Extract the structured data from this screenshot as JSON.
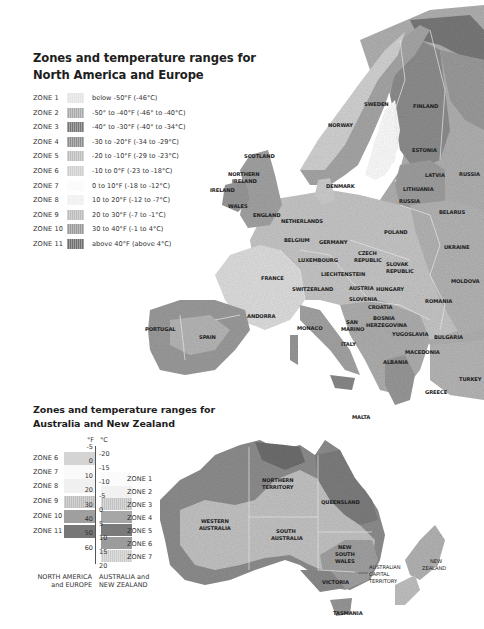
{
  "north_america_europe": {
    "title_line1": "Zones and temperature ranges for",
    "title_line2": "North America and Europe",
    "zones": [
      {
        "zone": "ZONE 1",
        "range": "below -50°F (-46°C)",
        "color": "#e4e4e4"
      },
      {
        "zone": "ZONE 2",
        "range": "-50° to -40°F (-46° to -40°C)",
        "color": "#a9a9a9"
      },
      {
        "zone": "ZONE 3",
        "range": "-40° to -30°F (-40° to -34°C)",
        "color": "#767676"
      },
      {
        "zone": "ZONE 4",
        "range": "-30 to -20°F (-34 to -29°C)",
        "color": "#8c8c8c"
      },
      {
        "zone": "ZONE 5",
        "range": "-20 to -10°F (-29 to -23°C)",
        "color": "#bdbdbd"
      },
      {
        "zone": "ZONE 6",
        "range": "-10 to 0°F (-23 to -18°C)",
        "color": "#cfcfcf"
      },
      {
        "zone": "ZONE 7",
        "range": "0 to 10°F (-18 to -12°C)",
        "color": "#fafafa"
      },
      {
        "zone": "ZONE 8",
        "range": "10 to 20°F (-12 to -7°C)",
        "color": "#efefef"
      },
      {
        "zone": "ZONE 9",
        "range": "20 to 30°F (-7 to -1°C)",
        "color": "#bbbbbb"
      },
      {
        "zone": "ZONE 10",
        "range": "30 to 40°F (-1 to 4°C)",
        "color": "#999999"
      },
      {
        "zone": "ZONE 11",
        "range": "above 40°F (above 4°C)",
        "color": "#6e6e6e"
      }
    ]
  },
  "australia_nz": {
    "title_line1": "Zones and temperature ranges for",
    "title_line2": "Australia and New Zealand",
    "unit_f": "°F",
    "unit_c": "°C",
    "f_ticks": [
      "-5",
      "0",
      "10",
      "20",
      "30",
      "40",
      "50",
      "60"
    ],
    "c_ticks": [
      "-20",
      "-15",
      "-10",
      "-5",
      "0",
      "5",
      "10",
      "15",
      "20"
    ],
    "na_zones": [
      "ZONE 6",
      "ZONE 7",
      "ZONE 8",
      "ZONE 9",
      "ZONE 10",
      "ZONE 11"
    ],
    "au_zones": [
      "ZONE 1",
      "ZONE 2",
      "ZONE 3",
      "ZONE 4",
      "ZONE 5",
      "ZONE 6",
      "ZONE 7"
    ],
    "footer_left_1": "NORTH AMERICA",
    "footer_left_2": "and EUROPE",
    "footer_right_1": "AUSTRALIA and",
    "footer_right_2": "NEW ZEALAND"
  },
  "europe_labels": {
    "sweden": "SWEDEN",
    "finland": "FINLAND",
    "norway": "NORWAY",
    "estonia": "ESTONIA",
    "latvia": "LATVIA",
    "russia_n": "RUSSIA",
    "lithuania": "LITHUANIA",
    "russia_k": "RUSSIA",
    "belarus": "BELARUS",
    "scotland": "SCOTLAND",
    "ni_1": "NORTHERN",
    "ni_2": "IRELAND",
    "ireland": "IRELAND",
    "wales": "WALES",
    "england": "ENGLAND",
    "denmark": "DENMARK",
    "netherlands": "NETHERLANDS",
    "belgium": "BELGIUM",
    "germany": "GERMANY",
    "poland": "POLAND",
    "ukraine": "UKRAINE",
    "luxembourg": "LUXEMBOURG",
    "czech_1": "CZECH",
    "czech_2": "REPUBLIC",
    "slovak_1": "SLOVAK",
    "slovak_2": "REPUBLIC",
    "liechtenstein": "LIECHTENSTEIN",
    "moldova": "MOLDOVA",
    "france": "FRANCE",
    "switzerland": "SWITZERLAND",
    "austria": "AUSTRIA",
    "hungary": "HUNGARY",
    "slovenia": "SLOVENIA",
    "croatia": "CROATIA",
    "romania": "ROMANIA",
    "bosnia_1": "BOSNIA",
    "bosnia_2": "HERZEGOVINA",
    "portugal": "PORTUGAL",
    "spain": "SPAIN",
    "andorra": "ANDORRA",
    "monaco": "MONACO",
    "sanmarino_1": "SAN",
    "sanmarino_2": "MARINO",
    "yugoslavia": "YUGOSLAVIA",
    "bulgaria": "BULGARIA",
    "italy": "ITALY",
    "macedonia": "MACEDONIA",
    "albania": "ALBANIA",
    "turkey": "TURKEY",
    "greece": "GREECE",
    "malta": "MALTA"
  },
  "australia_labels": {
    "nt_1": "NORTHERN",
    "nt_2": "TERRITORY",
    "qld": "QUEENSLAND",
    "wa_1": "WESTERN",
    "wa_2": "AUSTRALIA",
    "sa_1": "SOUTH",
    "sa_2": "AUSTRALIA",
    "nsw_1": "NEW",
    "nsw_2": "SOUTH",
    "nsw_3": "WALES",
    "act_1": "AUSTRALIAN",
    "act_2": "CAPITAL",
    "act_3": "TERRITORY",
    "vic": "VICTORIA",
    "tas": "TASMANIA",
    "nz_1": "NEW",
    "nz_2": "ZEALAND"
  }
}
